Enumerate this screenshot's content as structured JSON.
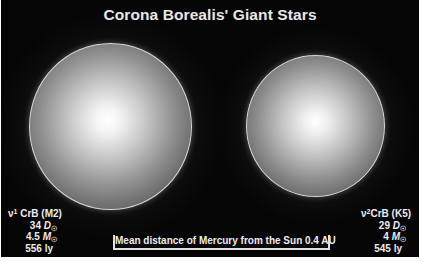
{
  "title": "Corona Borealis' Giant Stars",
  "stars": [
    {
      "name_prefix": "ν",
      "name_sup": "1",
      "name_suffix": " CrB (M2)",
      "diameter_value": "34 ",
      "diameter_symbol": "D",
      "diameter_sub": "☉",
      "mass_value": "4.5 ",
      "mass_symbol": "M",
      "mass_sub": "☉",
      "distance": "556 ly"
    },
    {
      "name_prefix": "ν",
      "name_sup": "2",
      "name_suffix": "CrB (K5)",
      "diameter_value": "29 ",
      "diameter_symbol": "D",
      "diameter_sub": "☉",
      "mass_value": "4 ",
      "mass_symbol": "M",
      "mass_sub": "☉",
      "distance": "545 ly"
    }
  ],
  "scale_bar": {
    "label": "Mean distance of Mercury from the Sun 0.4 AU"
  },
  "colors": {
    "background": "#050505",
    "text": "#ececec",
    "star_rim": "#d8d8d8",
    "star_core": "#ffffff"
  }
}
